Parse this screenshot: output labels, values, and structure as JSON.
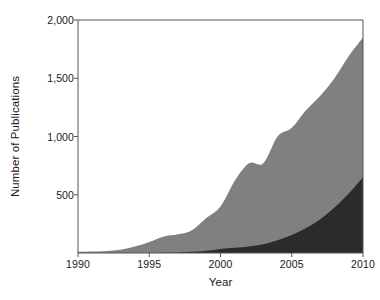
{
  "chart_data": {
    "type": "area",
    "stacked": true,
    "title": "",
    "xlabel": "Year",
    "ylabel": "Number of Publications",
    "xlim": [
      1990,
      2010
    ],
    "ylim": [
      0,
      2000
    ],
    "grid": false,
    "legend": "none",
    "xticks": [
      1990,
      1995,
      2000,
      2005,
      2010
    ],
    "xtick_labels": [
      "1990",
      "1995",
      "2000",
      "2005",
      "2010"
    ],
    "yticks": [
      500,
      1000,
      1500,
      2000
    ],
    "ytick_labels": [
      "500",
      "1,000",
      "1,500",
      "2,000"
    ],
    "x": [
      1990,
      1991,
      1992,
      1993,
      1994,
      1995,
      1996,
      1997,
      1998,
      1999,
      2000,
      2001,
      2002,
      2003,
      2004,
      2005,
      2006,
      2007,
      2008,
      2009,
      2010
    ],
    "series": [
      {
        "name": "lower-dark-series",
        "color": "#2b2b2b",
        "values": [
          0,
          0,
          0,
          0,
          0,
          0,
          2,
          5,
          10,
          20,
          35,
          45,
          55,
          75,
          110,
          155,
          215,
          290,
          390,
          510,
          650
        ]
      },
      {
        "name": "upper-gray-series",
        "color": "#808080",
        "values": [
          10,
          12,
          18,
          28,
          55,
          95,
          140,
          160,
          195,
          300,
          400,
          620,
          770,
          770,
          1000,
          1075,
          1225,
          1350,
          1500,
          1690,
          1850
        ],
        "note": "cumulative total (top of stack)"
      }
    ],
    "axis_color": "#555555",
    "background": "#ffffff"
  },
  "axes": {
    "y_title": "Number of Publications",
    "x_title": "Year"
  }
}
